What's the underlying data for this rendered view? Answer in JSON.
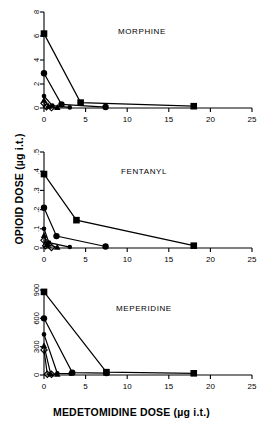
{
  "figure": {
    "xlabel": "MEDETOMIDINE DOSE (µg i.t.)",
    "ylabel": "OPIOID DOSE (µg i.t.)",
    "line_color": "#000000",
    "axis_color": "#000000",
    "background": "#ffffff"
  },
  "panels": [
    {
      "id": "morphine",
      "title": "MORPHINE"
    },
    {
      "id": "fentanyl",
      "title": "FENTANYL"
    },
    {
      "id": "meperidine",
      "title": "MEPERIDINE"
    }
  ],
  "chart_data": [
    {
      "type": "line",
      "title": "MORPHINE",
      "xlabel": "MEDETOMIDINE DOSE (µg i.t.)",
      "ylabel": "OPIOID DOSE (µg i.t.)",
      "xlim": [
        0,
        25
      ],
      "ylim": [
        0,
        8
      ],
      "xticks": [
        0,
        5,
        10,
        15,
        20,
        25
      ],
      "yticks": [
        0,
        2,
        4,
        6,
        8
      ],
      "xtick_labels": [
        "0",
        "5",
        "10",
        "15",
        "20",
        "25"
      ],
      "ytick_labels": [
        "0",
        "2",
        "4",
        "6",
        "8"
      ],
      "grid": false,
      "legend": "none",
      "series": [
        {
          "name": "isobole-1",
          "marker": "square",
          "points": [
            [
              0,
              6.2
            ],
            [
              4.4,
              0.45
            ],
            [
              18.0,
              0.15
            ]
          ]
        },
        {
          "name": "isobole-2",
          "marker": "circle",
          "points": [
            [
              0,
              2.9
            ],
            [
              2.1,
              0.3
            ],
            [
              7.4,
              0.08
            ]
          ]
        },
        {
          "name": "isobole-3",
          "marker": "circle-small",
          "points": [
            [
              0,
              1.0
            ],
            [
              1.0,
              0.2
            ],
            [
              3.1,
              0.05
            ]
          ]
        },
        {
          "name": "isobole-4",
          "marker": "triangle",
          "points": [
            [
              0,
              0.65
            ],
            [
              0.55,
              0.15
            ],
            [
              1.6,
              0.04
            ]
          ]
        },
        {
          "name": "isobole-5",
          "marker": "diamond",
          "points": [
            [
              0,
              0.4
            ],
            [
              0.3,
              0.1
            ],
            [
              0.9,
              0.03
            ]
          ]
        }
      ]
    },
    {
      "type": "line",
      "title": "FENTANYL",
      "xlabel": "MEDETOMIDINE DOSE (µg i.t.)",
      "ylabel": "OPIOID DOSE (µg i.t.)",
      "xlim": [
        0,
        25
      ],
      "ylim": [
        0,
        0.5
      ],
      "xticks": [
        0,
        5,
        10,
        15,
        20,
        25
      ],
      "yticks": [
        0,
        0.1,
        0.2,
        0.3,
        0.4,
        0.5
      ],
      "xtick_labels": [
        "0",
        "5",
        "10",
        "15",
        "20",
        "25"
      ],
      "ytick_labels": [
        "0",
        ".1",
        ".2",
        ".3",
        ".4",
        ".5"
      ],
      "grid": false,
      "legend": "none",
      "series": [
        {
          "name": "isobole-1",
          "marker": "square",
          "points": [
            [
              0,
              0.385
            ],
            [
              3.9,
              0.145
            ],
            [
              18.0,
              0.012
            ]
          ]
        },
        {
          "name": "isobole-2",
          "marker": "circle",
          "points": [
            [
              0,
              0.21
            ],
            [
              1.5,
              0.062
            ],
            [
              7.4,
              0.008
            ]
          ]
        },
        {
          "name": "isobole-3",
          "marker": "circle-small",
          "points": [
            [
              0,
              0.1
            ],
            [
              0.6,
              0.028
            ],
            [
              3.1,
              0.005
            ]
          ]
        },
        {
          "name": "isobole-4",
          "marker": "triangle",
          "points": [
            [
              0,
              0.065
            ],
            [
              0.35,
              0.018
            ],
            [
              1.6,
              0.004
            ]
          ]
        },
        {
          "name": "isobole-5",
          "marker": "diamond",
          "points": [
            [
              0,
              0.04
            ],
            [
              0.2,
              0.012
            ],
            [
              0.9,
              0.003
            ]
          ]
        }
      ]
    },
    {
      "type": "line",
      "title": "MEPERIDINE",
      "xlabel": "MEDETOMIDINE DOSE (µg i.t.)",
      "ylabel": "OPIOID DOSE (µg i.t.)",
      "xlim": [
        0,
        25
      ],
      "ylim": [
        0,
        900
      ],
      "xticks": [
        0,
        5,
        10,
        15,
        20,
        25
      ],
      "yticks": [
        0,
        300,
        600,
        900
      ],
      "xtick_labels": [
        "0",
        "5",
        "10",
        "15",
        "20",
        "25"
      ],
      "ytick_labels": [
        "0",
        "300",
        "600",
        "900"
      ],
      "grid": false,
      "legend": "none",
      "series": [
        {
          "name": "isobole-1",
          "marker": "square",
          "points": [
            [
              0,
              880
            ],
            [
              7.5,
              30
            ],
            [
              18.0,
              18
            ]
          ]
        },
        {
          "name": "isobole-2",
          "marker": "circle",
          "points": [
            [
              0,
              600
            ],
            [
              3.4,
              25
            ],
            [
              7.5,
              20
            ]
          ]
        },
        {
          "name": "isobole-3",
          "marker": "circle-small",
          "points": [
            [
              0,
              430
            ],
            [
              1.6,
              18
            ],
            [
              3.2,
              14
            ]
          ]
        },
        {
          "name": "isobole-4",
          "marker": "triangle",
          "points": [
            [
              0,
              310
            ],
            [
              0.8,
              12
            ],
            [
              1.6,
              10
            ]
          ]
        },
        {
          "name": "isobole-5",
          "marker": "diamond",
          "points": [
            [
              0,
              265
            ],
            [
              0.4,
              8
            ],
            [
              0.9,
              7
            ]
          ]
        }
      ]
    }
  ]
}
